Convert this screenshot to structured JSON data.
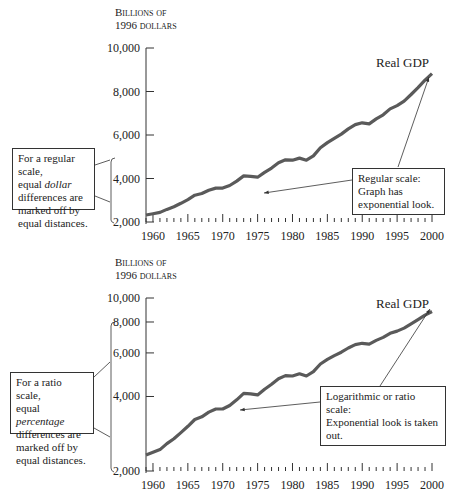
{
  "chart_data": [
    {
      "type": "line",
      "title": "Real GDP — Regular scale",
      "ylabel": "Billions of 1996 dollars",
      "xlabel": "",
      "scale": "linear",
      "ylim": [
        2000,
        10000
      ],
      "xlim": [
        1959,
        2000
      ],
      "yticks": [
        2000,
        4000,
        6000,
        8000,
        10000
      ],
      "ytick_labels": [
        "2,000",
        "4,000",
        "6,000",
        "8,000",
        "10,000"
      ],
      "xticks": [
        1960,
        1965,
        1970,
        1975,
        1980,
        1985,
        1990,
        1995,
        2000
      ],
      "series": [
        {
          "name": "Real GDP",
          "color": "#555555"
        }
      ],
      "annotations": [
        "Real GDP",
        "Regular scale: Graph has exponential look.",
        "For a regular scale, equal dollar differences are marked off by equal distances."
      ]
    },
    {
      "type": "line",
      "title": "Real GDP — Ratio scale",
      "ylabel": "Billions of 1996 dollars",
      "xlabel": "",
      "scale": "log",
      "ylim": [
        2000,
        10000
      ],
      "xlim": [
        1959,
        2000
      ],
      "yticks": [
        2000,
        4000,
        6000,
        8000,
        10000
      ],
      "ytick_labels": [
        "2,000",
        "4,000",
        "6,000",
        "8,000",
        "10,000"
      ],
      "xticks": [
        1960,
        1965,
        1970,
        1975,
        1980,
        1985,
        1990,
        1995,
        2000
      ],
      "series": [
        {
          "name": "Real GDP",
          "color": "#555555"
        }
      ],
      "annotations": [
        "Real GDP",
        "Logarithmic or ratio scale: Exponential look is taken out.",
        "For a ratio scale, equal percentage differences are marked off by equal distances."
      ]
    }
  ],
  "gdp": {
    "years": [
      1959,
      1960,
      1961,
      1962,
      1963,
      1964,
      1965,
      1966,
      1967,
      1968,
      1969,
      1970,
      1971,
      1972,
      1973,
      1974,
      1975,
      1976,
      1977,
      1978,
      1979,
      1980,
      1981,
      1982,
      1983,
      1984,
      1985,
      1986,
      1987,
      1988,
      1989,
      1990,
      1991,
      1992,
      1993,
      1994,
      1995,
      1996,
      1997,
      1998,
      1999,
      2000
    ],
    "values": [
      2320,
      2380,
      2440,
      2580,
      2700,
      2860,
      3030,
      3230,
      3310,
      3460,
      3560,
      3560,
      3680,
      3880,
      4120,
      4100,
      4060,
      4280,
      4480,
      4720,
      4860,
      4840,
      4940,
      4840,
      5040,
      5410,
      5650,
      5850,
      6040,
      6280,
      6480,
      6560,
      6510,
      6740,
      6930,
      7200,
      7350,
      7560,
      7860,
      8180,
      8520,
      8820
    ]
  },
  "top": {
    "ylabel_line1": "Billions of",
    "ylabel_line2": "1996 dollars",
    "series_label": "Real GDP",
    "note_title": "Regular scale:",
    "note_body_1": "Graph has",
    "note_body_2": "exponential look.",
    "side_note_1": "For a regular scale,",
    "side_note_2a": "equal ",
    "side_note_2b": "dollar",
    "side_note_3": "differences are",
    "side_note_4": "marked off by",
    "side_note_5": "equal distances."
  },
  "bottom": {
    "ylabel_line1": "Billions of",
    "ylabel_line2": "1996 dollars",
    "series_label": "Real GDP",
    "note_line_1": "Logarithmic or ratio scale:",
    "note_line_2": "Exponential look is taken out.",
    "side_note_1": "For a ratio scale,",
    "side_note_2a": "equal ",
    "side_note_2b": "percentage",
    "side_note_3": "differences are",
    "side_note_4": "marked off by",
    "side_note_5": "equal distances."
  },
  "colors": {
    "line": "#5a5a5a",
    "axis": "#333333",
    "text": "#222222"
  }
}
